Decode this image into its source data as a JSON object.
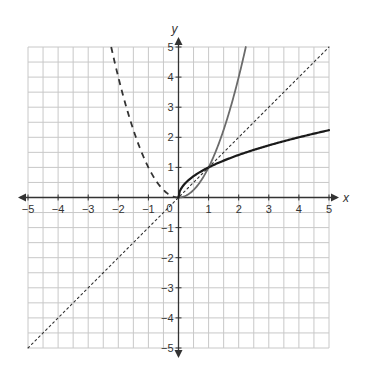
{
  "chart_data": {
    "type": "line",
    "title": "",
    "xlabel": "x",
    "ylabel": "y",
    "xlim": [
      -5,
      5
    ],
    "ylim": [
      -5,
      5
    ],
    "grid": true,
    "grid_minor_step": 0.5,
    "origin_label": "0",
    "x_ticks": [
      -5,
      -4,
      -3,
      -2,
      -1,
      1,
      2,
      3,
      4,
      5
    ],
    "y_ticks": [
      -5,
      -4,
      -3,
      -2,
      -1,
      1,
      2,
      3,
      4,
      5
    ],
    "series": [
      {
        "name": "y = x^2 (x >= 0)",
        "style": "solid",
        "color": "#6b6b6b",
        "domain": [
          0,
          2.236
        ],
        "x": [
          0,
          0.5,
          1,
          1.5,
          2,
          2.236
        ],
        "y": [
          0,
          0.25,
          1,
          2.25,
          4,
          5
        ]
      },
      {
        "name": "y = x^2 (x <= 0)",
        "style": "dashed",
        "color": "#333333",
        "domain": [
          -2.236,
          0
        ],
        "x": [
          -2.236,
          -2,
          -1.5,
          -1,
          -0.5,
          0
        ],
        "y": [
          5,
          4,
          2.25,
          1,
          0.25,
          0
        ]
      },
      {
        "name": "y = sqrt(x)",
        "style": "solid",
        "color": "#1a1a1a",
        "domain": [
          0,
          5
        ],
        "x": [
          0,
          0.25,
          1,
          2,
          3,
          4,
          5
        ],
        "y": [
          0,
          0.5,
          1,
          1.414,
          1.732,
          2,
          2.236
        ]
      },
      {
        "name": "y = x",
        "style": "dotted",
        "color": "#333333",
        "domain": [
          -5,
          5
        ],
        "x": [
          -5,
          0,
          5
        ],
        "y": [
          -5,
          0,
          5
        ]
      }
    ],
    "intersections": [
      [
        0,
        0
      ],
      [
        1,
        1
      ]
    ]
  },
  "colors": {
    "grid": "#c8c8c8",
    "axis": "#333333"
  }
}
